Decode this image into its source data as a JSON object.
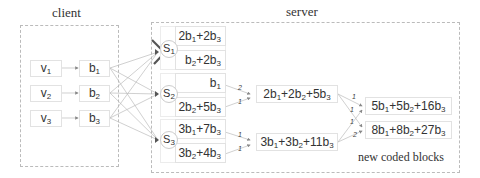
{
  "client": {
    "title": "client",
    "sources": [
      "v1",
      "v2",
      "v3"
    ],
    "blocks": [
      "b1",
      "b2",
      "b3"
    ]
  },
  "server": {
    "title": "server",
    "nodes": [
      {
        "label": "S1",
        "failed": true,
        "blocks": [
          "2b1+2b3",
          "b2+2b3"
        ]
      },
      {
        "label": "S2",
        "failed": false,
        "blocks": [
          "b1",
          "2b2+5b3"
        ]
      },
      {
        "label": "S3",
        "failed": false,
        "blocks": [
          "3b1+7b3",
          "3b2+4b3"
        ]
      }
    ],
    "intermediate": [
      "2b1+2b2+5b3",
      "3b1+3b2+11b3"
    ],
    "new_blocks": [
      "5b1+5b2+16b3",
      "8b1+8b2+27b3"
    ],
    "caption": "new coded blocks",
    "weights": {
      "s2_to_i1": [
        "2",
        "1"
      ],
      "s3_to_i2": [
        "1",
        "1"
      ],
      "i_to_new1": [
        "1",
        "1"
      ],
      "i_to_new2": [
        "1",
        "2"
      ]
    }
  },
  "colors": {
    "line": "#bbbbbb",
    "cross": "#555555",
    "border": "#bbbbbb"
  }
}
